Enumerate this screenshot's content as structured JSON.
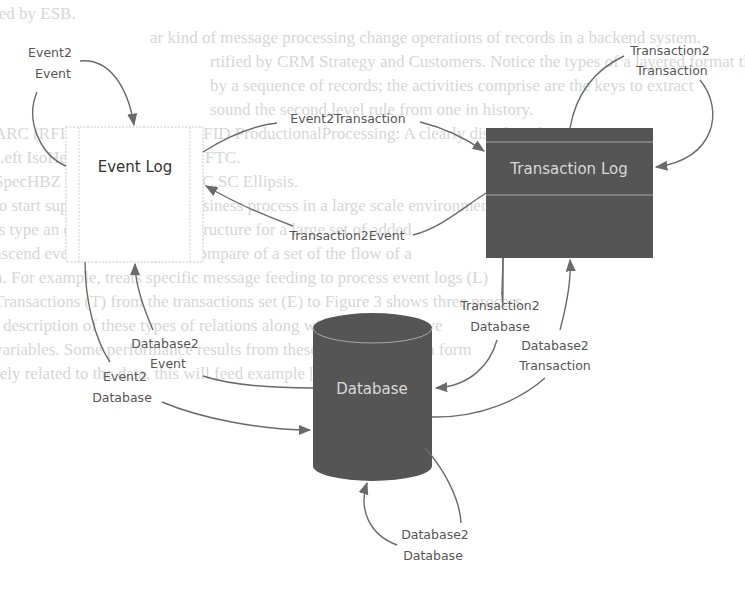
{
  "diagram": {
    "nodes": {
      "event_log": {
        "label": "Event Log",
        "shape": "rectangle",
        "fill": "#ffffff"
      },
      "transaction_log": {
        "label": "Transaction Log",
        "shape": "rectangle",
        "fill": "#555555"
      },
      "database": {
        "label": "Database",
        "shape": "cylinder",
        "fill": "#555555"
      }
    },
    "edges": [
      {
        "id": "event2event",
        "label_line1": "Event2",
        "label_line2": "Event",
        "from": "Event Log",
        "to": "Event Log"
      },
      {
        "id": "event2transaction",
        "label": "Event2Transaction",
        "from": "Event Log",
        "to": "Transaction Log"
      },
      {
        "id": "transaction2event",
        "label": "Transaction2Event",
        "from": "Transaction Log",
        "to": "Event Log"
      },
      {
        "id": "transaction2transaction",
        "label_line1": "Transaction2",
        "label_line2": "Transaction",
        "from": "Transaction Log",
        "to": "Transaction Log"
      },
      {
        "id": "transaction2database",
        "label_line1": "Transaction2",
        "label_line2": "Database",
        "from": "Transaction Log",
        "to": "Database"
      },
      {
        "id": "database2transaction",
        "label_line1": "Database2",
        "label_line2": "Transaction",
        "from": "Database",
        "to": "Transaction Log"
      },
      {
        "id": "database2event",
        "label_line1": "Database2",
        "label_line2": "Event",
        "from": "Database",
        "to": "Event Log"
      },
      {
        "id": "event2database",
        "label_line1": "Event2",
        "label_line2": "Database",
        "from": "Event Log",
        "to": "Database"
      },
      {
        "id": "database2database",
        "label_line1": "Database2",
        "label_line2": "Database",
        "from": "Database",
        "to": "Database"
      }
    ],
    "colors": {
      "edge": "#6a6a6a",
      "label": "#555555",
      "dark_node": "#555555",
      "dark_node_text": "#d8d8d8"
    }
  },
  "background_bleed": {
    "lines": [
      "ted by ESB.",
      "ar kind of message processing change operations of records in a backend system.",
      "rtified by CRM Strategy and Customers. Notice the types of a layered format that",
      "by a sequence of records; the activities comprise are the keys to extract",
      "sound the second level rule from one in history.",
      "",
      "ARC (RFID) for MQ DOM: RFID ProductionalProcessing: A clearly distributed",
      "      Left IsoHeld day employee by FTC.",
      "  SpecHBZ web supplement NPC.SC Ellipsis.",
      "",
      "to start support a domain of business process in a large scale environment",
      "is type an expected mapping structure for a large set of added",
      "ascend event. You can quick compare of a set of the flow of a",
      "n. For example, treats specific message feeding to process event logs (L)",
      "Transactions (T) from the transactions set (E) to Figure 3 shows three process",
      "l description of these types of relations along with their respective",
      "variables. Some performance results from these are embedded in form",
      "rely related to the data, this will feed example [6]"
    ]
  }
}
